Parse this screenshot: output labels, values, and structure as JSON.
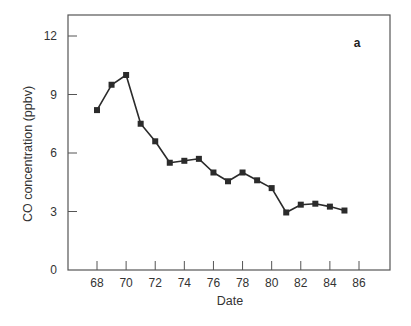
{
  "chart_data": {
    "type": "line",
    "title": "",
    "panel_label": "a",
    "xlabel": "Date",
    "ylabel": "CO concentration (ppbv)",
    "xlim": [
      66,
      88
    ],
    "ylim": [
      0,
      13
    ],
    "xticks": [
      68,
      70,
      72,
      74,
      76,
      78,
      80,
      82,
      84,
      86
    ],
    "yticks": [
      0,
      3,
      6,
      9,
      12
    ],
    "grid": false,
    "legend": null,
    "marker": "square",
    "series": [
      {
        "name": "CO concentration",
        "x": [
          68,
          69,
          70,
          71,
          72,
          73,
          74,
          75,
          76,
          77,
          78,
          79,
          80,
          81,
          82,
          83,
          84,
          85
        ],
        "y": [
          8.2,
          9.5,
          10.0,
          7.5,
          6.6,
          5.5,
          5.6,
          5.7,
          5.0,
          4.55,
          5.0,
          4.6,
          4.2,
          2.95,
          3.35,
          3.4,
          3.25,
          3.05
        ]
      }
    ]
  },
  "colors": {
    "line": "#2b2b2b",
    "marker": "#2b2b2b",
    "axis": "#555555",
    "text": "#333333"
  }
}
